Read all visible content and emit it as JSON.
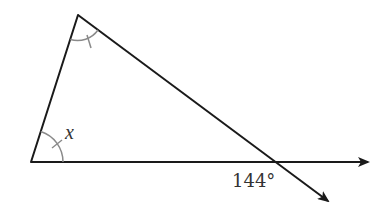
{
  "diagram": {
    "type": "geometry-triangle-exterior-angle",
    "labels": {
      "angle_x": "x",
      "exterior_angle": "144°"
    },
    "colors": {
      "line": "#1a1a1a",
      "arc": "#8a8a8a",
      "text": "#333333",
      "background": "#ffffff"
    },
    "points": {
      "top_vertex": [
        78,
        15
      ],
      "bottom_left_vertex": [
        31,
        162
      ],
      "intersection": [
        276,
        162
      ],
      "horizontal_arrow_tip": [
        368,
        162
      ],
      "diagonal_arrow_tip": [
        328,
        201
      ]
    },
    "angle_marks": {
      "top_vertex": "single-tick (equal to x)",
      "bottom_left_vertex": "single-tick, labeled x"
    }
  }
}
